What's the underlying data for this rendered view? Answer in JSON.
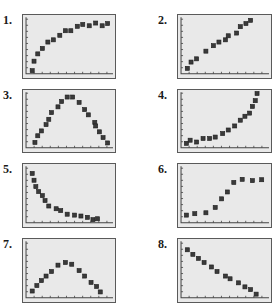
{
  "chart_data": [
    {
      "label": "1.",
      "type": "scatter",
      "title": "",
      "xlabel": "",
      "ylabel": "",
      "grid": false,
      "points": [
        [
          0.1,
          0.07
        ],
        [
          0.12,
          0.28
        ],
        [
          0.16,
          0.44
        ],
        [
          0.21,
          0.56
        ],
        [
          0.27,
          0.7
        ],
        [
          0.33,
          0.75
        ],
        [
          0.4,
          0.85
        ],
        [
          0.46,
          0.95
        ],
        [
          0.52,
          0.95
        ],
        [
          0.59,
          1.05
        ],
        [
          0.65,
          1.09
        ],
        [
          0.72,
          1.06
        ],
        [
          0.79,
          1.12
        ],
        [
          0.86,
          1.06
        ],
        [
          0.92,
          1.11
        ]
      ],
      "frame": {
        "left": 22,
        "top": 14,
        "width": 94,
        "height": 65
      }
    },
    {
      "label": "2.",
      "type": "scatter",
      "title": "",
      "xlabel": "",
      "ylabel": "",
      "grid": false,
      "points": [
        [
          0.1,
          0.12
        ],
        [
          0.14,
          0.26
        ],
        [
          0.2,
          0.33
        ],
        [
          0.3,
          0.5
        ],
        [
          0.38,
          0.62
        ],
        [
          0.44,
          0.7
        ],
        [
          0.51,
          0.75
        ],
        [
          0.54,
          0.84
        ],
        [
          0.63,
          0.9
        ],
        [
          0.67,
          1.04
        ],
        [
          0.73,
          1.11
        ],
        [
          0.78,
          1.18
        ]
      ],
      "frame": {
        "left": 177,
        "top": 14,
        "width": 95,
        "height": 65
      }
    },
    {
      "label": "3.",
      "type": "scatter",
      "title": "",
      "xlabel": "",
      "ylabel": "",
      "grid": false,
      "points": [
        [
          0.13,
          0.12
        ],
        [
          0.16,
          0.27
        ],
        [
          0.2,
          0.38
        ],
        [
          0.25,
          0.52
        ],
        [
          0.28,
          0.64
        ],
        [
          0.31,
          0.79
        ],
        [
          0.38,
          0.92
        ],
        [
          0.42,
          1.04
        ],
        [
          0.48,
          1.14
        ],
        [
          0.54,
          1.14
        ],
        [
          0.61,
          1.02
        ],
        [
          0.67,
          0.86
        ],
        [
          0.71,
          0.74
        ],
        [
          0.78,
          0.57
        ],
        [
          0.79,
          0.49
        ],
        [
          0.83,
          0.36
        ],
        [
          0.87,
          0.23
        ],
        [
          0.92,
          0.11
        ]
      ],
      "frame": {
        "left": 22,
        "top": 89,
        "width": 94,
        "height": 64
      }
    },
    {
      "label": "4.",
      "type": "scatter",
      "title": "",
      "xlabel": "",
      "ylabel": "",
      "grid": false,
      "points": [
        [
          0.09,
          0.1
        ],
        [
          0.13,
          0.17
        ],
        [
          0.2,
          0.13
        ],
        [
          0.27,
          0.21
        ],
        [
          0.34,
          0.21
        ],
        [
          0.4,
          0.24
        ],
        [
          0.48,
          0.32
        ],
        [
          0.54,
          0.4
        ],
        [
          0.61,
          0.49
        ],
        [
          0.67,
          0.62
        ],
        [
          0.72,
          0.71
        ],
        [
          0.77,
          0.78
        ],
        [
          0.8,
          0.93
        ],
        [
          0.83,
          1.06
        ],
        [
          0.85,
          1.22
        ]
      ],
      "frame": {
        "left": 177,
        "top": 89,
        "width": 95,
        "height": 64
      }
    },
    {
      "label": "5.",
      "type": "scatter",
      "title": "",
      "xlabel": "",
      "ylabel": "",
      "grid": false,
      "points": [
        [
          0.1,
          1.09
        ],
        [
          0.12,
          0.94
        ],
        [
          0.14,
          0.8
        ],
        [
          0.17,
          0.69
        ],
        [
          0.21,
          0.6
        ],
        [
          0.24,
          0.49
        ],
        [
          0.28,
          0.37
        ],
        [
          0.36,
          0.31
        ],
        [
          0.41,
          0.27
        ],
        [
          0.48,
          0.19
        ],
        [
          0.56,
          0.17
        ],
        [
          0.63,
          0.15
        ],
        [
          0.7,
          0.12
        ],
        [
          0.76,
          0.07
        ],
        [
          0.81,
          0.09
        ]
      ],
      "frame": {
        "left": 22,
        "top": 163,
        "width": 94,
        "height": 65
      }
    },
    {
      "label": "6.",
      "type": "scatter",
      "title": "",
      "xlabel": "",
      "ylabel": "",
      "grid": false,
      "points": [
        [
          0.09,
          0.17
        ],
        [
          0.18,
          0.2
        ],
        [
          0.3,
          0.22
        ],
        [
          0.4,
          0.34
        ],
        [
          0.47,
          0.53
        ],
        [
          0.53,
          0.68
        ],
        [
          0.6,
          0.89
        ],
        [
          0.69,
          0.96
        ],
        [
          0.8,
          0.93
        ],
        [
          0.9,
          0.95
        ]
      ],
      "frame": {
        "left": 177,
        "top": 163,
        "width": 95,
        "height": 65
      }
    },
    {
      "label": "7.",
      "type": "scatter",
      "title": "",
      "xlabel": "",
      "ylabel": "",
      "grid": false,
      "points": [
        [
          0.1,
          0.15
        ],
        [
          0.15,
          0.27
        ],
        [
          0.2,
          0.38
        ],
        [
          0.25,
          0.48
        ],
        [
          0.31,
          0.58
        ],
        [
          0.38,
          0.72
        ],
        [
          0.46,
          0.78
        ],
        [
          0.53,
          0.74
        ],
        [
          0.61,
          0.6
        ],
        [
          0.67,
          0.48
        ],
        [
          0.74,
          0.34
        ],
        [
          0.8,
          0.25
        ],
        [
          0.84,
          0.13
        ]
      ],
      "frame": {
        "left": 22,
        "top": 238,
        "width": 94,
        "height": 65
      }
    },
    {
      "label": "8.",
      "type": "scatter",
      "title": "",
      "xlabel": "",
      "ylabel": "",
      "grid": false,
      "points": [
        [
          0.1,
          1.06
        ],
        [
          0.16,
          0.96
        ],
        [
          0.22,
          0.87
        ],
        [
          0.28,
          0.78
        ],
        [
          0.36,
          0.68
        ],
        [
          0.42,
          0.58
        ],
        [
          0.51,
          0.48
        ],
        [
          0.56,
          0.42
        ],
        [
          0.65,
          0.33
        ],
        [
          0.72,
          0.24
        ],
        [
          0.78,
          0.18
        ],
        [
          0.84,
          0.08
        ]
      ],
      "frame": {
        "left": 177,
        "top": 238,
        "width": 95,
        "height": 65
      }
    }
  ],
  "labels": [
    "1.",
    "2.",
    "3.",
    "4.",
    "5.",
    "6.",
    "7.",
    "8."
  ]
}
